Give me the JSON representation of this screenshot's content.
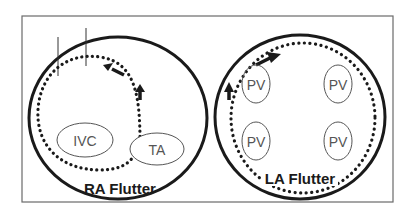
{
  "diagram": {
    "panels": [
      {
        "id": "ra",
        "title": "RA Flutter",
        "structures": [
          {
            "label": "IVC"
          },
          {
            "label": "TA"
          }
        ]
      },
      {
        "id": "la",
        "title": "LA Flutter",
        "structures": [
          {
            "label": "PV"
          },
          {
            "label": "PV"
          },
          {
            "label": "PV"
          },
          {
            "label": "PV"
          }
        ]
      }
    ],
    "colors": {
      "stroke": "#1a1a1a",
      "frame": "#6a6a6a",
      "thin": "#555555",
      "background": "#ffffff"
    }
  }
}
